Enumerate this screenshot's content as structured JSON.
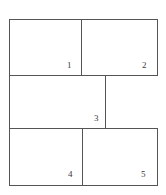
{
  "figure": {
    "kind": "rectangle-dissection-diagram",
    "width": 166,
    "height": 195,
    "background_color": "#ffffff",
    "line_color": "#555555",
    "line_width": 1,
    "label_color": "#3a3a3a",
    "bounds": {
      "left": 9,
      "top": 19,
      "right": 157,
      "bottom": 185
    },
    "rows": [
      {
        "name": "top-row",
        "top": 19,
        "bottom": 75
      },
      {
        "name": "middle-row",
        "top": 75,
        "bottom": 128
      },
      {
        "name": "bottom-row",
        "top": 128,
        "bottom": 185
      }
    ],
    "segments": [
      {
        "name": "outer-top-edge",
        "x1": 9,
        "y1": 19,
        "x2": 157,
        "y2": 19
      },
      {
        "name": "row1-row2-divider",
        "x1": 9,
        "y1": 75,
        "x2": 157,
        "y2": 75
      },
      {
        "name": "row2-row3-divider",
        "x1": 9,
        "y1": 128,
        "x2": 157,
        "y2": 128
      },
      {
        "name": "outer-bottom-edge",
        "x1": 9,
        "y1": 185,
        "x2": 157,
        "y2": 185
      },
      {
        "name": "outer-left-edge",
        "x1": 9,
        "y1": 19,
        "x2": 9,
        "y2": 185
      },
      {
        "name": "right-edge-top-row",
        "x1": 157,
        "y1": 19,
        "x2": 157,
        "y2": 75
      },
      {
        "name": "right-edge-bottom-row",
        "x1": 157,
        "y1": 128,
        "x2": 157,
        "y2": 185
      },
      {
        "name": "divider-cell1-cell2",
        "x1": 81,
        "y1": 19,
        "x2": 81,
        "y2": 75
      },
      {
        "name": "divider-cell3-right",
        "x1": 105,
        "y1": 75,
        "x2": 105,
        "y2": 128
      },
      {
        "name": "divider-cell4-cell5",
        "x1": 82,
        "y1": 128,
        "x2": 82,
        "y2": 185
      }
    ],
    "cells": [
      {
        "id": 1,
        "label": "1",
        "row": "top-row",
        "rect": {
          "x": 9,
          "y": 19,
          "w": 72,
          "h": 56
        },
        "label_x": 67,
        "label_y": 61
      },
      {
        "id": 2,
        "label": "2",
        "row": "top-row",
        "rect": {
          "x": 81,
          "y": 19,
          "w": 76,
          "h": 56
        },
        "label_x": 142,
        "label_y": 61
      },
      {
        "id": 3,
        "label": "3",
        "row": "middle-row",
        "rect": {
          "x": 9,
          "y": 75,
          "w": 96,
          "h": 53
        },
        "label_x": 94,
        "label_y": 114
      },
      {
        "id": 4,
        "label": "4",
        "row": "bottom-row",
        "rect": {
          "x": 9,
          "y": 128,
          "w": 73,
          "h": 57
        },
        "label_x": 68,
        "label_y": 170
      },
      {
        "id": 5,
        "label": "5",
        "row": "bottom-row",
        "rect": {
          "x": 82,
          "y": 128,
          "w": 75,
          "h": 57
        },
        "label_x": 141,
        "label_y": 170
      }
    ]
  }
}
